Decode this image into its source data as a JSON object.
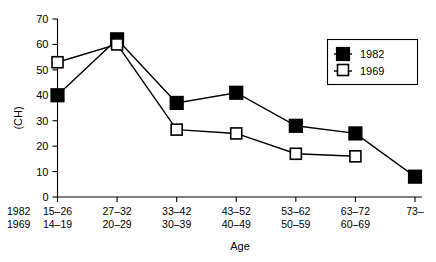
{
  "chart_data": {
    "type": "line",
    "title": "",
    "xlabel": "Age",
    "ylabel": "(CH)",
    "ylim": [
      0,
      70
    ],
    "yticks": [
      0,
      10,
      20,
      30,
      40,
      50,
      60,
      70
    ],
    "ytick_labels": [
      "0",
      "10",
      "20",
      "30",
      "40",
      "50",
      "60",
      "70"
    ],
    "grid": false,
    "legend_position": "top-right",
    "categories": [
      "15–26",
      "27–32",
      "33–42",
      "43–52",
      "53–62",
      "63–72",
      "73–"
    ],
    "categories_secondary": [
      "14–19",
      "20–29",
      "30–39",
      "40–49",
      "50–59",
      "60–69",
      ""
    ],
    "row_labels": [
      "1982",
      "1969"
    ],
    "series": [
      {
        "name": "1982",
        "marker": "filled-square",
        "values": [
          40,
          62,
          37,
          41,
          28,
          25,
          8
        ]
      },
      {
        "name": "1969",
        "marker": "open-square",
        "values": [
          53,
          60,
          26.5,
          25,
          17,
          16,
          null
        ]
      }
    ]
  },
  "legend": {
    "entries": [
      {
        "label": "1982",
        "marker": "filled-square"
      },
      {
        "label": "1969",
        "marker": "open-square"
      }
    ]
  }
}
